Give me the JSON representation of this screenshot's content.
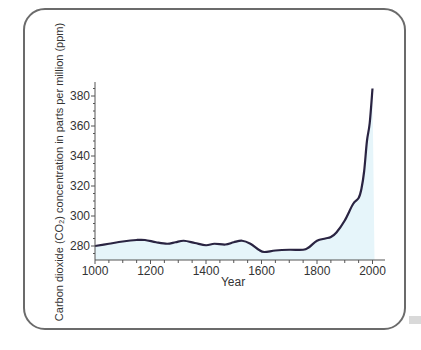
{
  "chart_data": {
    "type": "area",
    "title": "",
    "xlabel": "Year",
    "ylabel": "Carbon dioxide (CO₂) concentration in parts per million (ppm)",
    "xlim": [
      1000,
      2030
    ],
    "ylim": [
      270,
      390
    ],
    "xticks": [
      1000,
      1200,
      1400,
      1600,
      1800,
      2000
    ],
    "yticks": [
      280,
      300,
      320,
      340,
      360,
      380
    ],
    "grid": false,
    "legend": null,
    "series": [
      {
        "name": "CO2 concentration",
        "line_color": "#2a2442",
        "fill_color": "#e6f5fa",
        "x": [
          1000,
          1050,
          1100,
          1150,
          1180,
          1220,
          1260,
          1290,
          1320,
          1360,
          1400,
          1430,
          1470,
          1500,
          1530,
          1560,
          1590,
          1610,
          1650,
          1700,
          1750,
          1770,
          1800,
          1830,
          1850,
          1870,
          1900,
          1930,
          1950,
          1960,
          1970,
          1980,
          1990,
          2000
        ],
        "values": [
          280,
          281.5,
          283,
          284,
          284,
          282.5,
          281.5,
          282.5,
          283.5,
          282,
          280.5,
          281.5,
          281,
          282.5,
          283.5,
          281.5,
          277.5,
          276,
          277,
          277.5,
          277.5,
          279,
          283.5,
          285,
          286,
          289,
          297,
          308,
          312,
          318,
          330,
          350,
          362,
          385
        ]
      }
    ]
  },
  "labels": {
    "y_axis_title": "Carbon dioxide (CO₂) concentration in parts per million (ppm)",
    "x_axis_title": "Year"
  }
}
